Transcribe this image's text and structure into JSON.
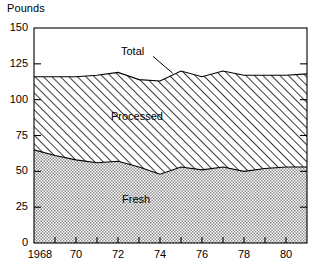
{
  "chart_data": {
    "type": "area",
    "title": "",
    "subtitle": "",
    "ylabel": "Pounds",
    "xlabel": "",
    "stacked": true,
    "grid": false,
    "legend_position": "inline-annotations",
    "xlim": [
      1968,
      1981
    ],
    "ylim": [
      0,
      150
    ],
    "yticks": [
      0,
      25,
      50,
      75,
      100,
      125,
      150
    ],
    "ytick_labels": [
      "0",
      "25",
      "50",
      "75",
      "100",
      "125",
      "150"
    ],
    "xticks": [
      1968,
      1969,
      1970,
      1971,
      1972,
      1973,
      1974,
      1975,
      1976,
      1977,
      1978,
      1979,
      1980,
      1981
    ],
    "xtick_labels": [
      "1968",
      "",
      "70",
      "",
      "72",
      "",
      "74",
      "",
      "76",
      "",
      "78",
      "",
      "80",
      ""
    ],
    "x": [
      1968,
      1969,
      1970,
      1971,
      1972,
      1973,
      1974,
      1975,
      1976,
      1977,
      1978,
      1979,
      1980,
      1981
    ],
    "series": [
      {
        "name": "Fresh",
        "fill": "dotted",
        "values": [
          65,
          61,
          58,
          56,
          57,
          53,
          48,
          53,
          51,
          53,
          50,
          52,
          53,
          53
        ]
      },
      {
        "name": "Processed",
        "fill": "diagonal-hatch",
        "values": [
          51,
          55,
          58,
          61,
          62,
          61,
          65,
          67,
          65,
          67,
          67,
          65,
          64,
          65
        ]
      }
    ],
    "total": {
      "name": "Total",
      "values": [
        116,
        116,
        116,
        117,
        119,
        114,
        113,
        120,
        116,
        120,
        117,
        117,
        117,
        118
      ]
    },
    "annotations": [
      {
        "text": "Total",
        "x": 1973,
        "y": 133
      },
      {
        "text": "Processed",
        "x": 1973,
        "y": 88
      },
      {
        "text": "Fresh",
        "x": 1973,
        "y": 30
      }
    ]
  },
  "axis": {
    "y_title": "Pounds",
    "y_labels": [
      "150",
      "125",
      "100",
      "75",
      "50",
      "25",
      "0"
    ],
    "x_labels": [
      "1968",
      "70",
      "72",
      "74",
      "76",
      "78",
      "80"
    ]
  },
  "labels": {
    "total": "Total",
    "processed": "Processed",
    "fresh": "Fresh"
  },
  "colors": {
    "axis": "#000000",
    "line": "#000000",
    "background": "#ffffff",
    "fresh_fill": "#cfcfcf",
    "processed_fill": "#ffffff"
  }
}
